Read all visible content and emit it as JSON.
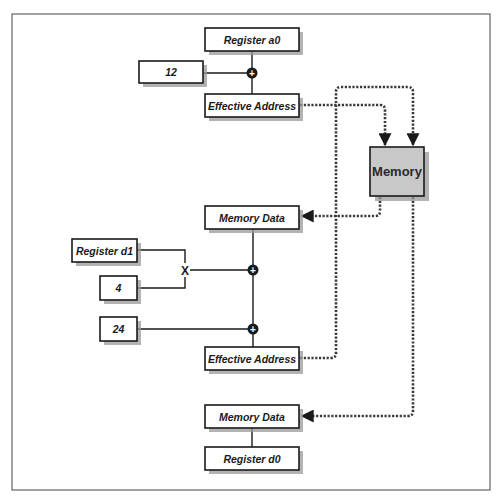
{
  "diagram": {
    "colors": {
      "line": "#1a1a1a",
      "memory_fill": "#c8c8c8",
      "box_fill": "#ffffff",
      "shadow": "#9a9a9a"
    },
    "nodes": {
      "register_a0": "Register a0",
      "displacement_12": "12",
      "effective_address_1": "Effective Address",
      "memory": "Memory",
      "memory_data_1": "Memory Data",
      "register_d1": "Register d1",
      "scale_4": "4",
      "displacement_24": "24",
      "effective_address_2": "Effective Address",
      "memory_data_2": "Memory Data",
      "register_d0": "Register d0"
    },
    "operators": {
      "add": "+",
      "multiply": "X"
    },
    "edges": [
      {
        "from": "Register a0",
        "to": "+ (1)",
        "style": "solid"
      },
      {
        "from": "12",
        "to": "+ (1)",
        "style": "solid"
      },
      {
        "from": "+ (1)",
        "to": "Effective Address (1)",
        "style": "solid"
      },
      {
        "from": "Effective Address (1)",
        "to": "Memory",
        "style": "dashed-arrow"
      },
      {
        "from": "Memory",
        "to": "Memory Data (1)",
        "style": "dashed-arrow"
      },
      {
        "from": "Register d1",
        "to": "X",
        "style": "solid"
      },
      {
        "from": "4",
        "to": "X",
        "style": "solid"
      },
      {
        "from": "X",
        "to": "+ (2)",
        "style": "solid"
      },
      {
        "from": "Memory Data (1)",
        "to": "+ (2)",
        "style": "solid"
      },
      {
        "from": "+ (2)",
        "to": "+ (3)",
        "style": "solid"
      },
      {
        "from": "24",
        "to": "+ (3)",
        "style": "solid"
      },
      {
        "from": "+ (3)",
        "to": "Effective Address (2)",
        "style": "solid"
      },
      {
        "from": "Effective Address (2)",
        "to": "Memory",
        "style": "dashed-arrow"
      },
      {
        "from": "Memory",
        "to": "Memory Data (2)",
        "style": "dashed-arrow"
      },
      {
        "from": "Memory Data (2)",
        "to": "Register d0",
        "style": "solid"
      }
    ]
  }
}
